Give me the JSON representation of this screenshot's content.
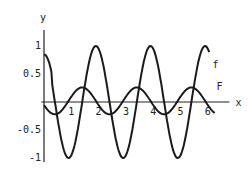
{
  "chart_data": {
    "type": "line",
    "title": "",
    "xlabel": "x",
    "ylabel": "y",
    "xlim": [
      0,
      6.5
    ],
    "ylim": [
      -1,
      1.1
    ],
    "x_ticks": [
      "1",
      "2",
      "3",
      "4",
      "5",
      "6"
    ],
    "y_ticks": [
      "1",
      "0.5",
      "-0.5",
      "-1"
    ],
    "y_tick_values": [
      1,
      0.5,
      -0.5,
      -1
    ],
    "x_tick_values": [
      1,
      2,
      3,
      4,
      5,
      6
    ],
    "grid": false,
    "series": [
      {
        "name": "f",
        "label": "f",
        "description": "oscillating curve, amplitude ~1, period ~2, peaks near x=1.9, 3.9, 5.9, troughs near x=0.9, 2.9, 4.9",
        "x": [
          0,
          0.5,
          0.9,
          1.4,
          1.9,
          2.4,
          2.9,
          3.4,
          3.9,
          4.4,
          4.9,
          5.4,
          5.9,
          6.1
        ],
        "y": [
          0.8,
          -0.3,
          -1,
          0,
          1,
          0,
          -1,
          0,
          1,
          0,
          -1,
          0,
          1,
          0.95
        ]
      },
      {
        "name": "F",
        "label": "F",
        "description": "small-amplitude oscillating curve, amplitude ~0.25",
        "x": [
          0,
          0.4,
          0.9,
          1.4,
          1.9,
          2.4,
          2.9,
          3.4,
          3.9,
          4.4,
          4.9,
          5.4,
          5.9,
          6.2
        ],
        "y": [
          0.1,
          0.25,
          0.08,
          -0.25,
          -0.05,
          0.25,
          0.05,
          -0.25,
          -0.05,
          0.25,
          0.05,
          -0.25,
          -0.05,
          0.1
        ]
      }
    ]
  }
}
